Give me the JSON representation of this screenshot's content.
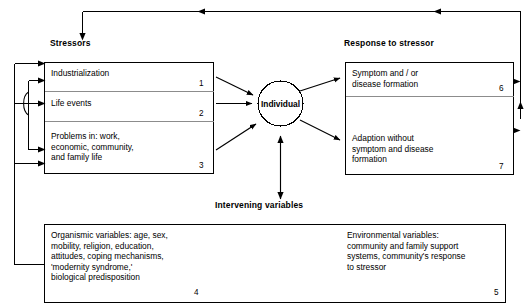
{
  "diagram": {
    "title_headings": {
      "stressors": "Stressors",
      "response": "Response to stressor",
      "intervening": "Intervening variables"
    },
    "center_node": {
      "label": "Individual",
      "shape": "circle"
    },
    "stressor_boxes": [
      {
        "id": "1",
        "text": "Industrialization"
      },
      {
        "id": "2",
        "text": "Life events"
      },
      {
        "id": "3",
        "text": "Problems in: work,\neconomic, community,\nand family life"
      }
    ],
    "response_boxes": [
      {
        "id": "6",
        "text": "Symptom and / or\ndisease formation"
      },
      {
        "id": "7",
        "text": "Adaption without\nsymptom and disease\nformation"
      }
    ],
    "intervening_boxes": [
      {
        "id": "4",
        "text": "Organismic variables: age, sex,\nmobility, religion, education,\nattitudes, coping mechanisms,\n'modernity syndrome,'\nbiological predisposition"
      },
      {
        "id": "5",
        "text": "Environmental variables:\ncommunity and family support\nsystems, community's response\nto stressor"
      }
    ],
    "colors": {
      "stroke": "#000000",
      "inner_rule": "#8c8c8c",
      "background": "#ffffff",
      "text": "#000000"
    }
  }
}
